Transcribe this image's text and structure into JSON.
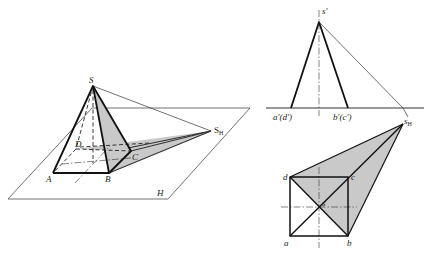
{
  "pictorial_view": {
    "plane_label": "H",
    "points": {
      "apex": "S",
      "a": "A",
      "b": "B",
      "c": "C",
      "d": "D",
      "shadow_apex": "S",
      "shadow_apex_sub": "H"
    }
  },
  "front_view": {
    "apex": "s′",
    "left_base": "a′(d′)",
    "right_base": "b′(c′)"
  },
  "top_view": {
    "shadow_apex": "s",
    "shadow_apex_sub": "H",
    "corners": {
      "a": "a",
      "b": "b",
      "c": "c",
      "d": "d"
    },
    "center": "s"
  },
  "colors": {
    "shade": "#c9c9c9",
    "line": "#111111"
  }
}
